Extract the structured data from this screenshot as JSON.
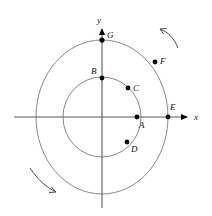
{
  "figure": {
    "background_color": "#ffffff",
    "stroke_color": "#6b6b6b",
    "axis_color": "#5a5a5a",
    "point_color": "#000000",
    "label_color": "#111111"
  },
  "axes": {
    "origin": {
      "x": 102,
      "y": 117
    },
    "x_axis": {
      "label": "x",
      "label_pos": {
        "x": 196,
        "y": 120
      },
      "start": {
        "x": 14,
        "y": 117
      },
      "end": {
        "x": 188,
        "y": 117
      },
      "arrow": "right"
    },
    "y_axis": {
      "label": "y",
      "label_pos": {
        "x": 99,
        "y": 23
      },
      "start": {
        "x": 102,
        "y": 208
      },
      "end": {
        "x": 102,
        "y": 28
      },
      "arrow": "up"
    }
  },
  "circles": [
    {
      "name": "inner-circle",
      "cx": 102,
      "cy": 117,
      "rx": 39,
      "ry": 40
    },
    {
      "name": "outer-circle",
      "cx": 102,
      "cy": 117,
      "rx": 66,
      "ry": 77
    }
  ],
  "points": [
    {
      "id": "A",
      "label": "A",
      "x": 137,
      "y": 117,
      "label_x": 139,
      "label_y": 128,
      "on": "inner-circle"
    },
    {
      "id": "B",
      "label": "B",
      "x": 102,
      "y": 78,
      "label_x": 92,
      "label_y": 74,
      "on": "inner-circle"
    },
    {
      "id": "C",
      "label": "C",
      "x": 128,
      "y": 88,
      "label_x": 133,
      "label_y": 90,
      "on": "inner-circle"
    },
    {
      "id": "D",
      "label": "D",
      "x": 127,
      "y": 142,
      "label_x": 131,
      "label_y": 152,
      "on": "inner-circle"
    },
    {
      "id": "E",
      "label": "E",
      "x": 168,
      "y": 117,
      "label_x": 170,
      "label_y": 110,
      "on": "outer-circle"
    },
    {
      "id": "F",
      "label": "F",
      "x": 155,
      "y": 62,
      "label_x": 160,
      "label_y": 63,
      "on": "outer-circle"
    },
    {
      "id": "G",
      "label": "G",
      "x": 102,
      "y": 40,
      "label_x": 107,
      "label_y": 38,
      "on": "outer-circle"
    }
  ],
  "rotation_arrows": [
    {
      "name": "rotation-arrow-top-right",
      "path": "M 178 48 C 174 38 168 32 160 29",
      "direction": "counterclockwise",
      "head": "M 160 29 L 166 28 M 160 29 L 163 34"
    },
    {
      "name": "rotation-arrow-bottom-left",
      "path": "M 30 168 C 38 180 46 187 56 192",
      "direction": "counterclockwise",
      "head": "M 56 192 L 49 192 M 56 192 L 52 187"
    }
  ]
}
